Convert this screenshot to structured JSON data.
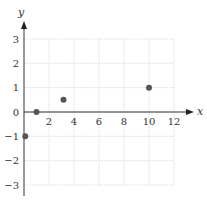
{
  "chart_data": {
    "type": "scatter",
    "title": "",
    "xlabel": "x",
    "ylabel": "y",
    "xlim": [
      0,
      12
    ],
    "ylim": [
      -3,
      3
    ],
    "grid": true,
    "xticks": [
      2,
      4,
      6,
      8,
      10,
      12
    ],
    "yticks": [
      3,
      2,
      1,
      0,
      -1,
      -2,
      -3
    ],
    "xtick_labels": [
      "2",
      "4",
      "6",
      "8",
      "10",
      "12"
    ],
    "ytick_labels": [
      "3",
      "2",
      "1",
      "0",
      "−1",
      "−2",
      "−3"
    ],
    "series": [
      {
        "name": "points",
        "color": "#555555",
        "points": [
          {
            "x": 0.1,
            "y": -1
          },
          {
            "x": 1,
            "y": 0
          },
          {
            "x": 3.16,
            "y": 0.5
          },
          {
            "x": 10,
            "y": 1
          }
        ]
      }
    ]
  }
}
